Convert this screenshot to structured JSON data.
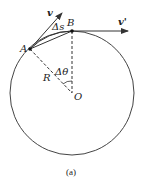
{
  "diagram": {
    "caption": "(a)",
    "labels": {
      "point_a": "A",
      "point_b": "B",
      "center": "O",
      "radius": "R",
      "velocity_a": "v",
      "velocity_b": "v'",
      "arc": "Δs",
      "angle": "Δθ"
    },
    "colors": {
      "stroke": "#333333",
      "text": "#222222",
      "background": "#ffffff"
    },
    "geometry": {
      "center": [
        72,
        93
      ],
      "radius": 62,
      "point_a": [
        30,
        49
      ],
      "point_b": [
        72,
        31
      ]
    }
  }
}
